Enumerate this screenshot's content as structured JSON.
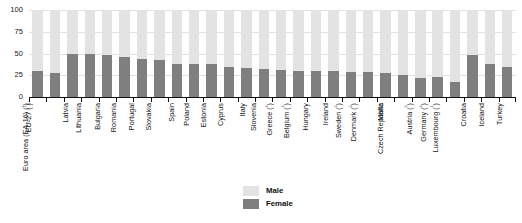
{
  "chart_data": {
    "type": "bar",
    "subtype": "stacked-100-percent-vertical",
    "title": "",
    "xlabel": "",
    "ylabel": "",
    "ylim": [
      0,
      100
    ],
    "yticks": [
      0,
      25,
      50,
      75,
      100
    ],
    "ytick_labels": [
      "0",
      "25",
      "50",
      "75",
      "100"
    ],
    "grid": true,
    "grid_axis": "y",
    "legend_position": "bottom-center",
    "legend": [
      "Male",
      "Female"
    ],
    "colors": {
      "male": "#e3e3e3",
      "female": "#7f7f7f",
      "axis": "#111111",
      "grid": "#e2e2e2",
      "text": "#111111",
      "background": "#ffffff"
    },
    "categories": [
      "EU-27 (¹)",
      "Euro area (EA-16) (¹)",
      "Latvia",
      "Lithuania",
      "Bulgaria",
      "Romania",
      "Portugal",
      "Slovakia",
      "Spain",
      "Poland",
      "Estonia",
      "Cyprus",
      "Italy",
      "Slovenia",
      "Greece (²)",
      "Belgium (²)",
      "Hungary",
      "Ireland",
      "Sweden (²)",
      "Denmark (²)",
      "Malta",
      "Czech Republic",
      "Austria (²)",
      "Germany (²)",
      "Luxembourg (²)",
      "Croatia",
      "Iceland",
      "Turkey"
    ],
    "series": [
      {
        "name": "Female",
        "values": [
          30,
          28,
          50,
          49,
          48,
          46,
          44,
          42,
          38,
          38,
          38,
          35,
          33,
          32,
          31,
          30,
          30,
          30,
          29,
          29,
          28,
          25,
          22,
          23,
          17,
          48,
          38,
          35
        ]
      },
      {
        "name": "Male",
        "values": [
          70,
          72,
          50,
          51,
          52,
          54,
          56,
          58,
          62,
          62,
          62,
          65,
          67,
          68,
          69,
          70,
          70,
          70,
          71,
          71,
          72,
          75,
          78,
          77,
          83,
          52,
          62,
          65
        ]
      }
    ]
  },
  "legend": {
    "items": [
      {
        "label": "Male",
        "key": "male"
      },
      {
        "label": "Female",
        "key": "female"
      }
    ]
  }
}
